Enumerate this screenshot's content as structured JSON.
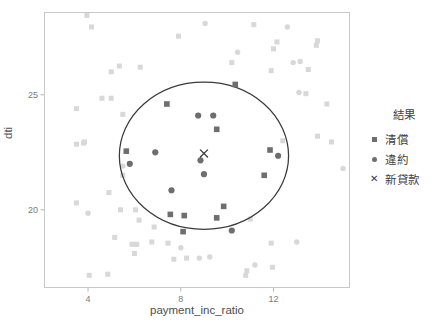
{
  "chart_data": {
    "type": "scatter",
    "title": "",
    "xlabel": "payment_inc_ratio",
    "ylabel": "dti",
    "xlim": [
      2.1,
      15.3
    ],
    "ylim": [
      16.6,
      28.6
    ],
    "xticks": [
      4,
      8,
      12
    ],
    "yticks": [
      20,
      25
    ],
    "grid": false,
    "legend": {
      "title": "結果",
      "position": "right",
      "entries": [
        {
          "label": "清償",
          "marker": "square",
          "color": "#6e6e6e"
        },
        {
          "label": "違約",
          "marker": "circle",
          "color": "#6e6e6e"
        },
        {
          "label": "新貸款",
          "marker": "cross",
          "color": "#3a3a3a"
        }
      ]
    },
    "annotations": [
      {
        "name": "knn-neighborhood-circle",
        "shape": "ellipse",
        "cx": 9.0,
        "cy": 22.35,
        "rx": 3.65,
        "ry": 3.2,
        "stroke": "#3a3a3a"
      }
    ],
    "new_point": {
      "x": 9.0,
      "y": 22.45,
      "marker": "cross",
      "label": "新貸款"
    },
    "series": [
      {
        "name": "清償",
        "marker": "square",
        "highlighted_color": "#6e6e6e",
        "faded_color": "#d8d8d8",
        "points": [
          {
            "x": 10.35,
            "y": 25.45,
            "highlighted": true
          },
          {
            "x": 7.4,
            "y": 24.6,
            "highlighted": true
          },
          {
            "x": 9.55,
            "y": 23.5,
            "highlighted": true
          },
          {
            "x": 11.85,
            "y": 22.6,
            "highlighted": true
          },
          {
            "x": 5.65,
            "y": 22.55,
            "highlighted": true
          },
          {
            "x": 11.6,
            "y": 21.5,
            "highlighted": true
          },
          {
            "x": 9.85,
            "y": 20.15,
            "highlighted": true
          },
          {
            "x": 8.15,
            "y": 19.75,
            "highlighted": true
          },
          {
            "x": 7.55,
            "y": 19.8,
            "highlighted": true
          },
          {
            "x": 9.55,
            "y": 19.65,
            "highlighted": true
          },
          {
            "x": 8.1,
            "y": 19.05,
            "highlighted": true
          },
          {
            "x": 12.4,
            "y": 23.0,
            "highlighted": false
          },
          {
            "x": 13.4,
            "y": 25.05,
            "highlighted": false
          },
          {
            "x": 13.5,
            "y": 26.1,
            "highlighted": false
          },
          {
            "x": 13.85,
            "y": 27.15,
            "highlighted": false
          },
          {
            "x": 13.9,
            "y": 27.35,
            "highlighted": false
          },
          {
            "x": 11.9,
            "y": 26.05,
            "highlighted": false
          },
          {
            "x": 12.0,
            "y": 27.0,
            "highlighted": false
          },
          {
            "x": 12.15,
            "y": 27.3,
            "highlighted": false
          },
          {
            "x": 11.15,
            "y": 28.05,
            "highlighted": false
          },
          {
            "x": 10.2,
            "y": 26.4,
            "highlighted": false
          },
          {
            "x": 5.35,
            "y": 26.25,
            "highlighted": false
          },
          {
            "x": 6.25,
            "y": 26.2,
            "highlighted": false
          },
          {
            "x": 5.0,
            "y": 26.0,
            "highlighted": false
          },
          {
            "x": 4.15,
            "y": 27.95,
            "highlighted": false
          },
          {
            "x": 3.95,
            "y": 28.45,
            "highlighted": false
          },
          {
            "x": 7.9,
            "y": 27.55,
            "highlighted": false
          },
          {
            "x": 4.6,
            "y": 24.85,
            "highlighted": false
          },
          {
            "x": 5.0,
            "y": 24.85,
            "highlighted": false
          },
          {
            "x": 3.5,
            "y": 24.4,
            "highlighted": false
          },
          {
            "x": 5.5,
            "y": 24.15,
            "highlighted": false
          },
          {
            "x": 3.5,
            "y": 22.85,
            "highlighted": false
          },
          {
            "x": 3.8,
            "y": 22.9,
            "highlighted": false
          },
          {
            "x": 3.85,
            "y": 22.95,
            "highlighted": false
          },
          {
            "x": 14.5,
            "y": 22.95,
            "highlighted": false
          },
          {
            "x": 13.9,
            "y": 23.2,
            "highlighted": false
          },
          {
            "x": 14.3,
            "y": 24.6,
            "highlighted": false
          },
          {
            "x": 5.5,
            "y": 21.5,
            "highlighted": false
          },
          {
            "x": 4.9,
            "y": 20.75,
            "highlighted": false
          },
          {
            "x": 5.4,
            "y": 20.0,
            "highlighted": false
          },
          {
            "x": 6.05,
            "y": 20.0,
            "highlighted": false
          },
          {
            "x": 3.5,
            "y": 20.3,
            "highlighted": false
          },
          {
            "x": 6.2,
            "y": 19.55,
            "highlighted": false
          },
          {
            "x": 6.85,
            "y": 19.25,
            "highlighted": false
          },
          {
            "x": 5.15,
            "y": 18.8,
            "highlighted": false
          },
          {
            "x": 5.9,
            "y": 18.5,
            "highlighted": false
          },
          {
            "x": 6.0,
            "y": 18.5,
            "highlighted": false
          },
          {
            "x": 6.1,
            "y": 18.5,
            "highlighted": false
          },
          {
            "x": 6.75,
            "y": 18.6,
            "highlighted": false
          },
          {
            "x": 6.0,
            "y": 18.1,
            "highlighted": false
          },
          {
            "x": 7.45,
            "y": 18.55,
            "highlighted": false
          },
          {
            "x": 7.7,
            "y": 17.85,
            "highlighted": false
          },
          {
            "x": 8.25,
            "y": 17.9,
            "highlighted": false
          },
          {
            "x": 11.9,
            "y": 18.55,
            "highlighted": false
          },
          {
            "x": 11.95,
            "y": 17.5,
            "highlighted": false
          },
          {
            "x": 10.85,
            "y": 17.35,
            "highlighted": false
          },
          {
            "x": 10.8,
            "y": 17.15,
            "highlighted": false
          },
          {
            "x": 4.05,
            "y": 17.15,
            "highlighted": false
          },
          {
            "x": 4.85,
            "y": 17.2,
            "highlighted": false
          },
          {
            "x": 11.0,
            "y": 19.6,
            "highlighted": false
          }
        ]
      },
      {
        "name": "違約",
        "marker": "circle",
        "highlighted_color": "#6e6e6e",
        "faded_color": "#d8d8d8",
        "points": [
          {
            "x": 8.75,
            "y": 24.1,
            "highlighted": true
          },
          {
            "x": 9.4,
            "y": 24.1,
            "highlighted": true
          },
          {
            "x": 6.9,
            "y": 22.5,
            "highlighted": true
          },
          {
            "x": 8.85,
            "y": 22.15,
            "highlighted": true
          },
          {
            "x": 5.8,
            "y": 22.0,
            "highlighted": true
          },
          {
            "x": 9.0,
            "y": 21.55,
            "highlighted": true
          },
          {
            "x": 7.6,
            "y": 20.85,
            "highlighted": true
          },
          {
            "x": 12.2,
            "y": 22.35,
            "highlighted": true
          },
          {
            "x": 10.2,
            "y": 19.1,
            "highlighted": true
          },
          {
            "x": 12.6,
            "y": 27.95,
            "highlighted": false
          },
          {
            "x": 9.05,
            "y": 28.1,
            "highlighted": false
          },
          {
            "x": 13.1,
            "y": 25.1,
            "highlighted": false
          },
          {
            "x": 12.85,
            "y": 26.4,
            "highlighted": false
          },
          {
            "x": 13.15,
            "y": 26.45,
            "highlighted": false
          },
          {
            "x": 15.0,
            "y": 21.8,
            "highlighted": false
          },
          {
            "x": 4.0,
            "y": 19.85,
            "highlighted": false
          },
          {
            "x": 8.0,
            "y": 18.35,
            "highlighted": false
          },
          {
            "x": 8.8,
            "y": 17.9,
            "highlighted": false
          },
          {
            "x": 9.25,
            "y": 17.95,
            "highlighted": false
          },
          {
            "x": 11.2,
            "y": 17.6,
            "highlighted": false
          },
          {
            "x": 13.0,
            "y": 18.6,
            "highlighted": false
          },
          {
            "x": 5.5,
            "y": 21.9,
            "highlighted": false
          },
          {
            "x": 10.45,
            "y": 26.85,
            "highlighted": false
          }
        ]
      }
    ]
  }
}
